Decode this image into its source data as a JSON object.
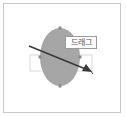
{
  "illustration": {
    "label": "드래그",
    "colors": {
      "frame_border": "#c8c8c8",
      "ellipse_fill": "#a6a6a6",
      "handle": "#8a8a8a",
      "selection_box": "#d8d8d8",
      "arrow": "#3a3a3a",
      "label_border": "#9a9a9a",
      "label_text": "#555555"
    }
  }
}
